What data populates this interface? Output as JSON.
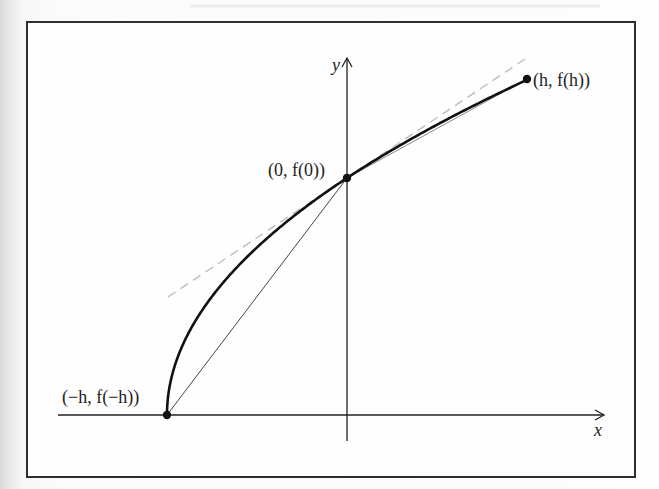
{
  "figure": {
    "axes": {
      "x_label": "x",
      "y_label": "y"
    },
    "points": [
      {
        "id": "minus-h",
        "label": "(−h, f(−h))",
        "math_x": "-h",
        "math_y": "f(-h)"
      },
      {
        "id": "zero",
        "label": "(0, f(0))",
        "math_x": "0",
        "math_y": "f(0)"
      },
      {
        "id": "plus-h",
        "label": "(h, f(h))",
        "math_x": "h",
        "math_y": "f(h)"
      }
    ],
    "elements": {
      "curve": "y = f(x), concave down, increasing",
      "tangent_line": "dashed tangent at (0, f(0))",
      "secant_left": "chord from (-h, f(-h)) to (0, f(0))",
      "secant_right": "chord from (0, f(0)) to (h, f(h))"
    },
    "colors": {
      "curve": "#111111",
      "axes": "#222222",
      "secant": "#444444",
      "tangent_dashed": "#bdbdbd",
      "frame": "#2e2e2e"
    }
  },
  "chart_data": {
    "type": "line",
    "title": "",
    "xlabel": "x",
    "ylabel": "y",
    "series": [
      {
        "name": "f(x)",
        "style": "solid-thick",
        "x": [
          "-h",
          "0",
          "h"
        ],
        "y": [
          "f(-h)",
          "f(0)",
          "f(h)"
        ]
      },
      {
        "name": "tangent at 0",
        "style": "dashed-gray"
      },
      {
        "name": "secant (-h,0)",
        "style": "thin"
      },
      {
        "name": "secant (0,h)",
        "style": "thin"
      }
    ],
    "annotations": [
      "(−h, f(−h))",
      "(0, f(0))",
      "(h, f(h))"
    ],
    "grid": false,
    "legend": "none"
  }
}
